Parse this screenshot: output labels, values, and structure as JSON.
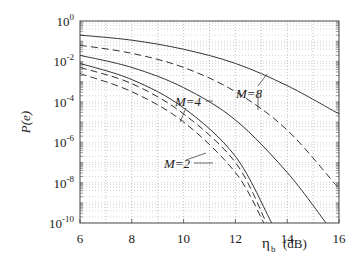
{
  "chart_data": {
    "type": "line",
    "title": "",
    "xlabel": "η_b (dB)",
    "ylabel": "P(e)",
    "xlim": [
      6,
      16
    ],
    "ylim_exp": [
      -10,
      0
    ],
    "yscale": "log",
    "grid": true,
    "x_ticks": [
      "6",
      "8",
      "10",
      "12",
      "14",
      "16"
    ],
    "y_ticks": [
      "10^0",
      "10^-2",
      "10^-4",
      "10^-6",
      "10^-8",
      "10^-10"
    ],
    "series": [
      {
        "name": "M=8 (solid)",
        "style": "solid",
        "x": [
          6,
          8,
          10,
          12,
          14,
          16
        ],
        "log10_y": [
          -0.7,
          -0.95,
          -1.4,
          -2.1,
          -3.2,
          -4.6
        ]
      },
      {
        "name": "M=8 (dashed)",
        "style": "dashed",
        "x": [
          6,
          8,
          10,
          12,
          14,
          16
        ],
        "log10_y": [
          -1.2,
          -1.6,
          -2.3,
          -3.5,
          -5.4,
          -8.3
        ]
      },
      {
        "name": "M=4 (solid)",
        "style": "solid",
        "x": [
          6,
          8,
          10,
          12,
          14,
          15.5
        ],
        "log10_y": [
          -1.7,
          -2.3,
          -3.3,
          -4.9,
          -7.5,
          -10
        ]
      },
      {
        "name": "M=4 (dashed)",
        "style": "dashed",
        "x": [
          6,
          8,
          10,
          12,
          13.2
        ],
        "log10_y": [
          -2.3,
          -3.1,
          -4.6,
          -7.0,
          -10
        ]
      },
      {
        "name": "M=2 (solid)",
        "style": "solid",
        "x": [
          6,
          8,
          10,
          12,
          13.4
        ],
        "log10_y": [
          -2.1,
          -2.9,
          -4.3,
          -6.7,
          -10
        ]
      },
      {
        "name": "M=2 (dashed)",
        "style": "dashed",
        "x": [
          6,
          8,
          10,
          12,
          13.1
        ],
        "log10_y": [
          -2.6,
          -3.5,
          -5.0,
          -7.5,
          -10
        ]
      }
    ],
    "annotations": [
      "M=8",
      "M=4",
      "M=2"
    ]
  },
  "labels": {
    "ylabel": "P(e)",
    "xlabel_main": "η",
    "xlabel_sub": "b",
    "xlabel_unit": "(dB)",
    "m8": "M=8",
    "m4": "M=4",
    "m2": "M=2"
  }
}
